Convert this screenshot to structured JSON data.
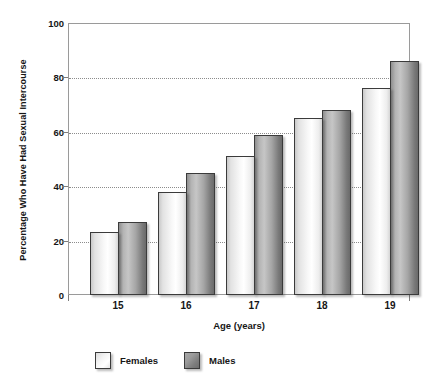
{
  "chart_data": {
    "type": "bar",
    "title": "",
    "xlabel": "Age (years)",
    "ylabel": "Percentage Who Have Had Sexual Intercourse",
    "categories": [
      "15",
      "16",
      "17",
      "18",
      "19"
    ],
    "series": [
      {
        "name": "Females",
        "values": [
          23,
          38,
          51,
          65,
          76
        ],
        "color": "#f2f2f2"
      },
      {
        "name": "Males",
        "values": [
          27,
          45,
          59,
          68,
          86
        ],
        "color": "#8c8c8c"
      }
    ],
    "ylim": [
      0,
      100
    ],
    "yticks": [
      0,
      20,
      40,
      60,
      80,
      100
    ],
    "ytick_labels": [
      "0",
      "20",
      "40",
      "60",
      "80",
      "100"
    ],
    "grid": "horizontal-dotted",
    "legend_position": "bottom-left"
  },
  "axes": {
    "y_title": "Percentage Who Have Had Sexual Intercourse",
    "x_title": "Age (years)",
    "y_labels": [
      "100",
      "80",
      "60",
      "40",
      "20",
      "0"
    ],
    "x_labels": [
      "15",
      "16",
      "17",
      "18",
      "19"
    ]
  },
  "legend": {
    "items": [
      {
        "label": "Females",
        "swatch": "legend-swatch-females"
      },
      {
        "label": "Males",
        "swatch": "legend-swatch-males"
      }
    ]
  }
}
